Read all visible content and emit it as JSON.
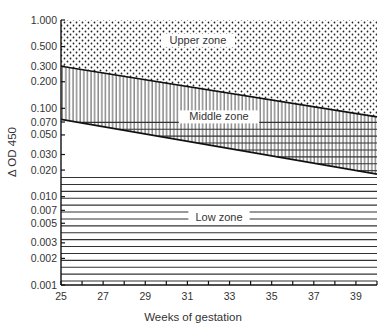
{
  "chart_data": {
    "type": "area",
    "title": "",
    "xlabel": "Weeks of gestation",
    "ylabel": "Δ OD 450",
    "xlim": [
      25,
      40
    ],
    "ylim": [
      0.001,
      1.0
    ],
    "yscale": "log",
    "x_ticks": [
      25,
      27,
      29,
      31,
      33,
      35,
      37,
      39
    ],
    "x_minor_ticks": [
      26,
      28,
      30,
      32,
      34,
      36,
      38,
      40
    ],
    "y_ticks": [
      1.0,
      0.5,
      0.3,
      0.2,
      0.1,
      0.07,
      0.05,
      0.03,
      0.02,
      0.01,
      0.007,
      0.005,
      0.003,
      0.002,
      0.001
    ],
    "y_tick_labels": [
      "1.000",
      "0.500",
      "0.300",
      "0.200",
      "0.100",
      "0.070",
      "0.050",
      "0.030",
      "0.020",
      "0.010",
      "0.007",
      "0.005",
      "0.003",
      "0.002",
      "0.001"
    ],
    "grid": false,
    "series": [
      {
        "name": "Upper/Middle boundary",
        "x": [
          25,
          40
        ],
        "values": [
          0.3,
          0.08
        ]
      },
      {
        "name": "Middle/Low boundary",
        "x": [
          25,
          40
        ],
        "values": [
          0.075,
          0.018
        ]
      }
    ],
    "zones": [
      {
        "name": "Upper zone",
        "pattern": "dots",
        "label_x": 31.5,
        "label_y": 0.55
      },
      {
        "name": "Middle zone",
        "pattern": "vertical-lines",
        "label_x": 32.5,
        "label_y": 0.075
      },
      {
        "name": "Low zone",
        "pattern": "horizontal-lines",
        "label_x": 32.5,
        "label_y": 0.0055
      }
    ]
  },
  "labels": {
    "xlabel": "Weeks of gestation",
    "ylabel": "Δ OD 450",
    "upper_zone": "Upper zone",
    "middle_zone": "Middle zone",
    "low_zone": "Low zone"
  }
}
